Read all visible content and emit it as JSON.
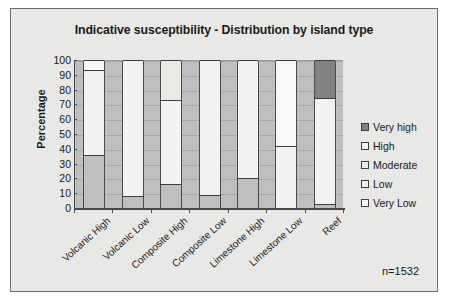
{
  "chart_data": {
    "type": "bar",
    "subtype": "stacked-100-percent",
    "title": "Indicative susceptibility - Distribution by island type",
    "xlabel": "",
    "ylabel": "Percentage",
    "ylim": [
      0,
      100
    ],
    "yticks": [
      0,
      10,
      20,
      30,
      40,
      50,
      60,
      70,
      80,
      90,
      100
    ],
    "grid": true,
    "legend_position": "right",
    "annotation": "n=1532",
    "categories": [
      "Volcanic High",
      "Volcanic Low",
      "Composite High",
      "Composite Low",
      "Limestone High",
      "Limestone Low",
      "Reef"
    ],
    "series": [
      {
        "name": "Very Low",
        "color": "#bfbfbf",
        "values": [
          36,
          8,
          16,
          9,
          20,
          0,
          3
        ]
      },
      {
        "name": "Low",
        "color": "#f2f2f0",
        "values": [
          57,
          92,
          57,
          91,
          80,
          42,
          71
        ]
      },
      {
        "name": "Moderate",
        "color": "#eceae4",
        "values": [
          0,
          0,
          27,
          0,
          0,
          0,
          0
        ]
      },
      {
        "name": "High",
        "color": "#f7f7f5",
        "values": [
          7,
          0,
          0,
          0,
          0,
          58,
          0
        ]
      },
      {
        "name": "Very high",
        "color": "#828282",
        "values": [
          0,
          0,
          0,
          0,
          0,
          0,
          26
        ]
      }
    ],
    "legend_entries": [
      {
        "label": "Very high",
        "color": "#828282"
      },
      {
        "label": "High",
        "color": "#f7f7f5"
      },
      {
        "label": "Moderate",
        "color": "#eceae4"
      },
      {
        "label": "Low",
        "color": "#f2f2f0"
      },
      {
        "label": "Very Low",
        "color": "#f7f7f5"
      }
    ]
  }
}
